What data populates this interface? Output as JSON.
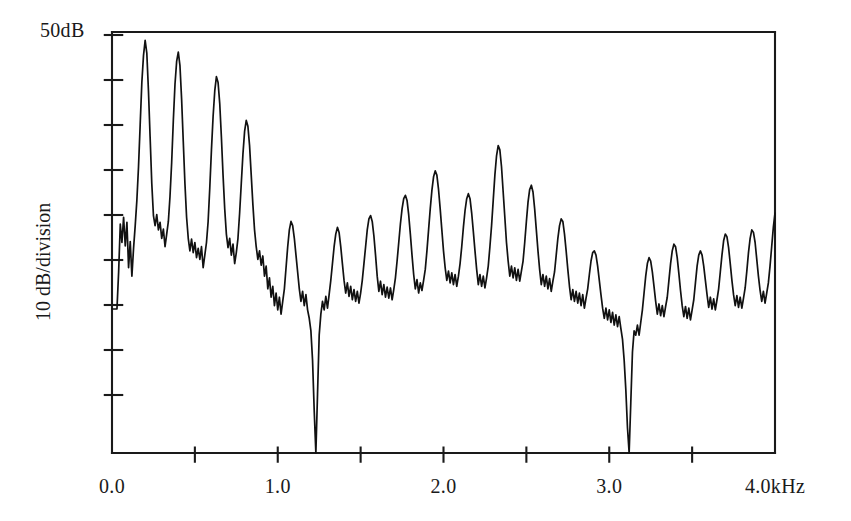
{
  "chart_data": {
    "type": "line",
    "title": "",
    "subtitle": "",
    "xlabel": "",
    "ylabel": "10 dB/division",
    "y_top_label": "50dB",
    "x_unit_label": "4.0kHz",
    "xlim": [
      0.0,
      4.0
    ],
    "ylim": [
      0,
      50
    ],
    "grid": false,
    "legend": null,
    "x_tick_labels": [
      "0.0",
      "1.0",
      "2.0",
      "3.0",
      "4.0kHz"
    ],
    "x_tick_values": [
      0.0,
      1.0,
      2.0,
      3.0,
      4.0
    ],
    "x_minor_tick_values": [
      0.5,
      1.5,
      2.5,
      3.5
    ],
    "y_tick_values": [
      45,
      40,
      35,
      30,
      25,
      20,
      15,
      10
    ],
    "y_axis_note": "10 dB per division, top of axis = 50 dB",
    "x": [
      0.0,
      0.01,
      0.02,
      0.03,
      0.04,
      0.05,
      0.06,
      0.07,
      0.08,
      0.09,
      0.1,
      0.11,
      0.12,
      0.13,
      0.14,
      0.15,
      0.16,
      0.17,
      0.18,
      0.19,
      0.2,
      0.21,
      0.22,
      0.23,
      0.24,
      0.25,
      0.26,
      0.27,
      0.28,
      0.29,
      0.3,
      0.31,
      0.32,
      0.33,
      0.34,
      0.35,
      0.36,
      0.37,
      0.38,
      0.39,
      0.4,
      0.41,
      0.42,
      0.43,
      0.44,
      0.45,
      0.46,
      0.47,
      0.48,
      0.49,
      0.5,
      0.51,
      0.52,
      0.53,
      0.54,
      0.55,
      0.56,
      0.57,
      0.58,
      0.59,
      0.6,
      0.61,
      0.62,
      0.63,
      0.64,
      0.65,
      0.66,
      0.67,
      0.68,
      0.69,
      0.7,
      0.71,
      0.72,
      0.73,
      0.74,
      0.75,
      0.76,
      0.77,
      0.78,
      0.79,
      0.8,
      0.81,
      0.82,
      0.83,
      0.84,
      0.85,
      0.86,
      0.87,
      0.88,
      0.89,
      0.9,
      0.91,
      0.92,
      0.93,
      0.94,
      0.95,
      0.96,
      0.97,
      0.98,
      0.99,
      1.0,
      1.01,
      1.02,
      1.03,
      1.04,
      1.05,
      1.06,
      1.07,
      1.08,
      1.09,
      1.1,
      1.11,
      1.12,
      1.13,
      1.14,
      1.15,
      1.16,
      1.17,
      1.18,
      1.19,
      1.2,
      1.21,
      1.22,
      1.23,
      1.24,
      1.25,
      1.26,
      1.27,
      1.28,
      1.29,
      1.3,
      1.31,
      1.32,
      1.33,
      1.34,
      1.35,
      1.36,
      1.37,
      1.38,
      1.39,
      1.4,
      1.41,
      1.42,
      1.43,
      1.44,
      1.45,
      1.46,
      1.47,
      1.48,
      1.49,
      1.5,
      1.51,
      1.52,
      1.53,
      1.54,
      1.55,
      1.56,
      1.57,
      1.58,
      1.59,
      1.6,
      1.61,
      1.62,
      1.63,
      1.64,
      1.65,
      1.66,
      1.67,
      1.68,
      1.69,
      1.7,
      1.71,
      1.72,
      1.73,
      1.74,
      1.75,
      1.76,
      1.77,
      1.78,
      1.79,
      1.8,
      1.81,
      1.82,
      1.83,
      1.84,
      1.85,
      1.86,
      1.87,
      1.88,
      1.89,
      1.9,
      1.91,
      1.92,
      1.93,
      1.94,
      1.95,
      1.96,
      1.97,
      1.98,
      1.99,
      2.0,
      2.01,
      2.02,
      2.03,
      2.04,
      2.05,
      2.06,
      2.07,
      2.08,
      2.09,
      2.1,
      2.11,
      2.12,
      2.13,
      2.14,
      2.15,
      2.16,
      2.17,
      2.18,
      2.19,
      2.2,
      2.21,
      2.22,
      2.23,
      2.24,
      2.25,
      2.26,
      2.27,
      2.28,
      2.29,
      2.3,
      2.31,
      2.32,
      2.33,
      2.34,
      2.35,
      2.36,
      2.37,
      2.38,
      2.39,
      2.4,
      2.41,
      2.42,
      2.43,
      2.44,
      2.45,
      2.46,
      2.47,
      2.48,
      2.49,
      2.5,
      2.51,
      2.52,
      2.53,
      2.54,
      2.55,
      2.56,
      2.57,
      2.58,
      2.59,
      2.6,
      2.61,
      2.62,
      2.63,
      2.64,
      2.65,
      2.66,
      2.67,
      2.68,
      2.69,
      2.7,
      2.71,
      2.72,
      2.73,
      2.74,
      2.75,
      2.76,
      2.77,
      2.78,
      2.79,
      2.8,
      2.81,
      2.82,
      2.83,
      2.84,
      2.85,
      2.86,
      2.87,
      2.88,
      2.89,
      2.9,
      2.91,
      2.92,
      2.93,
      2.94,
      2.95,
      2.96,
      2.97,
      2.98,
      2.99,
      3.0,
      3.01,
      3.02,
      3.03,
      3.04,
      3.05,
      3.06,
      3.07,
      3.08,
      3.09,
      3.1,
      3.11,
      3.12,
      3.13,
      3.14,
      3.15,
      3.16,
      3.17,
      3.18,
      3.19,
      3.2,
      3.21,
      3.22,
      3.23,
      3.24,
      3.25,
      3.26,
      3.27,
      3.28,
      3.29,
      3.3,
      3.31,
      3.32,
      3.33,
      3.34,
      3.35,
      3.36,
      3.37,
      3.38,
      3.39,
      3.4,
      3.41,
      3.42,
      3.43,
      3.44,
      3.45,
      3.46,
      3.47,
      3.48,
      3.49,
      3.5,
      3.51,
      3.52,
      3.53,
      3.54,
      3.55,
      3.56,
      3.57,
      3.58,
      3.59,
      3.6,
      3.61,
      3.62,
      3.63,
      3.64,
      3.65,
      3.66,
      3.67,
      3.68,
      3.69,
      3.7,
      3.71,
      3.72,
      3.73,
      3.74,
      3.75,
      3.76,
      3.77,
      3.78,
      3.79,
      3.8,
      3.81,
      3.82,
      3.83,
      3.84,
      3.85,
      3.86,
      3.87,
      3.88,
      3.89,
      3.9,
      3.91,
      3.92,
      3.93,
      3.94,
      3.95,
      3.96,
      3.97,
      3.98,
      3.99,
      4.0
    ],
    "y": [
      17.1,
      17.1,
      17.1,
      17.1,
      21.5,
      27.2,
      25.0,
      28.0,
      24.6,
      27.4,
      22.0,
      25.1,
      21.0,
      24.3,
      27.0,
      30.0,
      34.0,
      39.0,
      44.0,
      47.2,
      49.0,
      47.5,
      43.0,
      37.5,
      32.0,
      28.2,
      27.0,
      28.3,
      26.5,
      27.4,
      25.5,
      26.6,
      24.5,
      26.0,
      27.5,
      30.5,
      34.5,
      39.5,
      43.8,
      46.5,
      47.6,
      46.0,
      42.0,
      37.0,
      32.0,
      28.0,
      25.5,
      24.0,
      25.4,
      23.8,
      25.0,
      23.2,
      24.3,
      23.0,
      24.5,
      22.0,
      23.5,
      25.0,
      27.5,
      31.5,
      36.0,
      40.0,
      43.0,
      44.7,
      44.0,
      41.5,
      37.5,
      33.0,
      29.0,
      26.0,
      24.4,
      25.5,
      23.5,
      24.8,
      22.5,
      23.8,
      25.5,
      28.5,
      32.0,
      35.5,
      38.2,
      39.5,
      38.8,
      36.5,
      33.0,
      29.5,
      26.5,
      24.5,
      23.0,
      24.0,
      22.3,
      23.4,
      21.0,
      22.2,
      19.5,
      20.8,
      18.5,
      19.8,
      17.5,
      19.0,
      17.0,
      18.5,
      16.5,
      18.0,
      19.5,
      22.0,
      24.5,
      26.5,
      27.5,
      27.0,
      25.5,
      23.5,
      21.5,
      19.5,
      18.0,
      19.2,
      17.5,
      18.8,
      17.0,
      16.0,
      14.5,
      11.0,
      5.0,
      0.0,
      7.0,
      14.0,
      16.5,
      18.0,
      17.0,
      18.6,
      17.2,
      18.8,
      20.5,
      22.5,
      24.5,
      26.0,
      26.8,
      26.2,
      24.5,
      22.5,
      20.5,
      19.0,
      20.2,
      18.6,
      19.8,
      18.2,
      19.4,
      18.0,
      19.2,
      17.8,
      19.0,
      20.5,
      22.5,
      24.5,
      26.5,
      27.8,
      28.2,
      27.5,
      25.8,
      23.5,
      21.0,
      19.2,
      20.4,
      18.8,
      20.0,
      18.5,
      19.7,
      18.4,
      19.6,
      18.2,
      19.4,
      20.8,
      22.8,
      25.0,
      27.2,
      29.0,
      30.2,
      30.6,
      30.0,
      28.3,
      26.0,
      23.5,
      21.2,
      19.5,
      20.6,
      19.0,
      20.2,
      19.3,
      20.5,
      21.8,
      24.0,
      26.5,
      29.0,
      31.2,
      32.8,
      33.5,
      33.0,
      31.3,
      29.0,
      26.5,
      24.0,
      22.0,
      20.5,
      21.6,
      20.2,
      21.4,
      20.0,
      21.2,
      19.8,
      21.0,
      22.5,
      24.5,
      26.8,
      28.8,
      30.2,
      30.8,
      30.2,
      28.5,
      26.3,
      24.0,
      21.8,
      20.0,
      21.2,
      19.8,
      21.0,
      19.6,
      20.8,
      22.2,
      24.5,
      27.0,
      30.0,
      33.0,
      35.3,
      36.5,
      36.0,
      34.0,
      31.0,
      28.0,
      25.0,
      22.8,
      21.0,
      22.2,
      20.8,
      22.0,
      20.5,
      21.8,
      20.4,
      21.6,
      22.8,
      25.0,
      27.5,
      29.8,
      31.3,
      31.8,
      31.0,
      29.0,
      26.5,
      24.0,
      21.8,
      20.0,
      21.2,
      19.8,
      21.0,
      19.5,
      20.7,
      19.2,
      20.4,
      21.5,
      23.5,
      25.5,
      27.0,
      27.8,
      27.5,
      26.0,
      24.0,
      21.8,
      19.8,
      18.2,
      19.4,
      18.0,
      19.2,
      17.8,
      19.0,
      17.5,
      18.8,
      17.2,
      18.4,
      19.5,
      21.2,
      22.8,
      23.8,
      24.0,
      23.5,
      22.2,
      20.5,
      18.8,
      17.2,
      16.0,
      17.2,
      15.8,
      17.0,
      15.5,
      16.7,
      15.2,
      16.4,
      15.0,
      16.2,
      14.8,
      13.5,
      11.0,
      7.5,
      3.0,
      0.0,
      6.0,
      12.0,
      14.5,
      14.0,
      15.2,
      14.0,
      15.5,
      17.0,
      19.0,
      21.0,
      22.5,
      23.2,
      22.8,
      21.5,
      19.8,
      18.0,
      16.5,
      17.7,
      16.3,
      17.5,
      16.2,
      17.4,
      18.5,
      20.5,
      22.5,
      24.0,
      24.8,
      24.5,
      23.2,
      21.3,
      19.3,
      17.5,
      16.2,
      17.4,
      16.0,
      17.2,
      15.8,
      17.0,
      18.2,
      20.2,
      22.2,
      23.5,
      24.0,
      23.5,
      22.2,
      20.5,
      18.8,
      17.3,
      18.5,
      17.1,
      18.3,
      17.0,
      18.2,
      19.5,
      21.5,
      23.5,
      25.2,
      26.0,
      25.7,
      24.4,
      22.5,
      20.5,
      18.8,
      17.5,
      18.7,
      17.3,
      18.5,
      17.2,
      18.4,
      19.6,
      21.6,
      23.8,
      25.5,
      26.5,
      26.2,
      25.0,
      23.0,
      21.0,
      19.3,
      18.0,
      19.2,
      17.8,
      19.0,
      20.2,
      22.2,
      24.5,
      26.8,
      28.5,
      29.3,
      29.0,
      27.5,
      25.5,
      23.5,
      21.8,
      20.5,
      21.7,
      20.3,
      21.5,
      22.8,
      25.0,
      27.5,
      30.0,
      31.8,
      32.5,
      32.0,
      30.5,
      28.5,
      26.5,
      24.8,
      23.5,
      24.7,
      23.3,
      24.5,
      23.2
    ]
  },
  "axes": {
    "left_x": 112,
    "right_x": 775,
    "top_y": 32,
    "bottom_y": 453,
    "y_tick_pixels": [
      35,
      80,
      125,
      170,
      215,
      260,
      305,
      350,
      395
    ],
    "tick_length": 15,
    "x_tick_length": 13
  },
  "labels": {
    "y_top": "50dB",
    "y_title": "10 dB/division",
    "x_0": "0.0",
    "x_1": "1.0",
    "x_2": "2.0",
    "x_3": "3.0",
    "x_4": "4.0kHz"
  },
  "style": {
    "background": "#ffffff",
    "ink": "#1a1a1a",
    "trace_color": "#111111"
  }
}
